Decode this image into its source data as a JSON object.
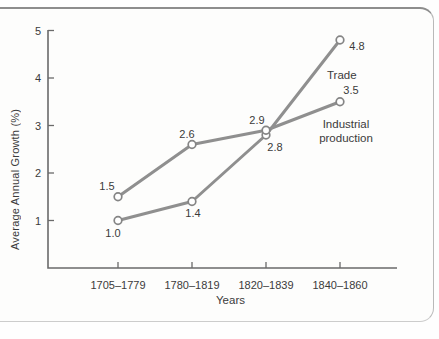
{
  "chart_data": {
    "type": "line",
    "title": "",
    "categories": [
      "1705–1779",
      "1780–1819",
      "1820–1839",
      "1840–1860"
    ],
    "series": [
      {
        "name": "Trade",
        "values": [
          1.0,
          1.4,
          2.8,
          4.8
        ],
        "point_labels": [
          "1.0",
          "1.4",
          "2.8",
          "4.8"
        ]
      },
      {
        "name": "Industrial production",
        "values": [
          1.5,
          2.6,
          2.9,
          3.5
        ],
        "point_labels": [
          "1.5",
          "2.6",
          "2.9",
          "3.5"
        ]
      }
    ],
    "xlabel": "Years",
    "ylabel": "Average Annual Growth (%)",
    "ylim": [
      0,
      5
    ],
    "yticks": [
      "1",
      "2",
      "3",
      "4",
      "5"
    ],
    "grid": false,
    "legend_position": "inline-annotations",
    "colors": {
      "line": "#8f8f8f",
      "marker_fill": "#ffffff",
      "marker_stroke": "#858585",
      "axis": "#6a6a6a",
      "text": "#3b3b3b"
    }
  },
  "annotations": {
    "trade": "Trade",
    "industrial_line1": "Industrial",
    "industrial_line2": "production"
  }
}
